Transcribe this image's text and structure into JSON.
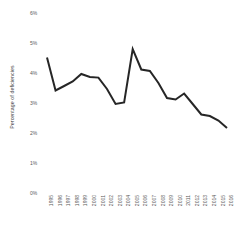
{
  "chart_data": {
    "type": "line",
    "title": "",
    "xlabel": "",
    "ylabel": "Percentage of deficiencies",
    "ylim": [
      0,
      6
    ],
    "ytick_labels": [
      "0%",
      "1%",
      "2%",
      "3%",
      "4%",
      "5%",
      "6%"
    ],
    "ytick_values": [
      0,
      1,
      2,
      3,
      4,
      5,
      6
    ],
    "grid": false,
    "legend": "none",
    "line_color": "#262626",
    "categories": [
      "1995",
      "1996",
      "1997",
      "1998",
      "1999",
      "2000",
      "2001",
      "2002",
      "2003",
      "2004",
      "2005",
      "2006",
      "2007",
      "2008",
      "2009",
      "2010",
      "2011",
      "2012",
      "2013",
      "2014",
      "2015",
      "2016"
    ],
    "values": [
      4.55,
      3.45,
      3.6,
      3.75,
      4.0,
      3.9,
      3.88,
      3.5,
      3.0,
      3.05,
      4.83,
      4.15,
      4.1,
      3.7,
      3.2,
      3.15,
      3.35,
      3.0,
      2.65,
      2.6,
      2.45,
      2.2
    ]
  }
}
